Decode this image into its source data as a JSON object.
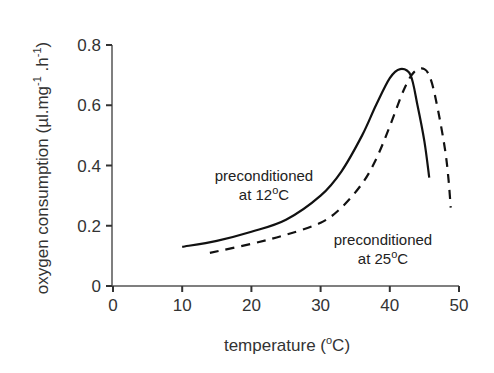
{
  "chart_data": {
    "type": "line",
    "title": "",
    "xlabel": "temperature (oC)",
    "ylabel": "oxygen consumption (µl.mg-1.h-1)",
    "xlim": [
      0,
      50
    ],
    "ylim": [
      0,
      0.8
    ],
    "x_ticks": [
      0,
      10,
      20,
      30,
      40,
      50
    ],
    "y_ticks": [
      0,
      0.2,
      0.4,
      0.6,
      0.8
    ],
    "x_tick_labels": [
      "0",
      "10",
      "20",
      "30",
      "40",
      "50"
    ],
    "y_tick_labels": [
      "0",
      "0.2",
      "0.4",
      "0.6",
      "0.8"
    ],
    "grid": false,
    "legend": null,
    "series": [
      {
        "name": "preconditioned at 12oC",
        "style": "solid",
        "x": [
          10,
          15,
          20,
          25,
          30,
          33,
          36,
          38,
          40,
          41.5,
          43,
          44,
          45,
          45.7
        ],
        "y": [
          0.13,
          0.15,
          0.18,
          0.22,
          0.3,
          0.38,
          0.5,
          0.6,
          0.69,
          0.72,
          0.7,
          0.6,
          0.48,
          0.36
        ]
      },
      {
        "name": "preconditioned at 25oC",
        "style": "dashed",
        "x": [
          14,
          20,
          25,
          30,
          33,
          36,
          38,
          40,
          42,
          43.5,
          45,
          46,
          47,
          48,
          48.5,
          48.8
        ],
        "y": [
          0.11,
          0.14,
          0.17,
          0.21,
          0.26,
          0.34,
          0.42,
          0.53,
          0.65,
          0.71,
          0.72,
          0.68,
          0.58,
          0.45,
          0.35,
          0.26
        ]
      }
    ],
    "annotations": [
      {
        "line1": "preconditioned",
        "line2": "at 12",
        "sup": "o",
        "unit": "C",
        "series": "solid"
      },
      {
        "line1": "preconditioned",
        "line2": "at 25",
        "sup": "o",
        "unit": "C",
        "series": "dashed"
      }
    ]
  },
  "labels": {
    "x_title_main": "temperature (",
    "x_title_sup": "o",
    "x_title_end": "C)",
    "y_title_main": "oxygen consumption (µl.mg",
    "y_title_sup1": "-1",
    "y_title_mid": " .h",
    "y_title_sup2": "-1",
    "y_title_end": ")"
  }
}
